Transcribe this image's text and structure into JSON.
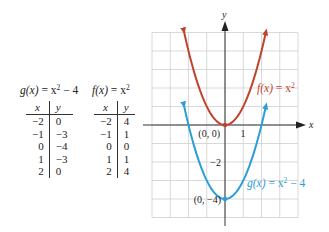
{
  "tables": [
    {
      "title_fn": "g(x)",
      "title_eq": " = x",
      "title_exp": "2",
      "title_tail": " − 4",
      "col_x": "x",
      "col_y": "y",
      "rows": [
        [
          "−2",
          "0"
        ],
        [
          "−1",
          "−3"
        ],
        [
          "0",
          "−4"
        ],
        [
          "1",
          "−3"
        ],
        [
          "2",
          "0"
        ]
      ]
    },
    {
      "title_fn": "f(x)",
      "title_eq": " = x",
      "title_exp": "2",
      "title_tail": "",
      "col_x": "x",
      "col_y": "y",
      "rows": [
        [
          "−2",
          "4"
        ],
        [
          "−1",
          "1"
        ],
        [
          "0",
          "0"
        ],
        [
          "1",
          "1"
        ],
        [
          "2",
          "4"
        ]
      ]
    }
  ],
  "chart_data": {
    "type": "line",
    "title": "",
    "xlabel": "x",
    "ylabel": "y",
    "xlim": [
      -4,
      4
    ],
    "ylim": [
      -5,
      5
    ],
    "grid": true,
    "tick_labels": {
      "x": [
        "1"
      ],
      "y": [
        "−2"
      ]
    },
    "series": [
      {
        "name": "f(x) = x²",
        "color": "#c0432b",
        "domain": [
          -2.25,
          2.25
        ],
        "points": [
          [
            -2,
            4
          ],
          [
            -1,
            1
          ],
          [
            0,
            0
          ],
          [
            1,
            1
          ],
          [
            2,
            4
          ]
        ]
      },
      {
        "name": "g(x) = x² − 4",
        "color": "#2a9fd6",
        "domain": [
          -2.25,
          2.25
        ],
        "points": [
          [
            -2,
            0
          ],
          [
            -1,
            -3
          ],
          [
            0,
            -4
          ],
          [
            1,
            -3
          ],
          [
            2,
            0
          ]
        ]
      }
    ],
    "annotations": [
      {
        "text": "(0, 0)",
        "x": 0,
        "y": 0
      },
      {
        "text": "(0, −4)",
        "x": 0,
        "y": -4
      }
    ],
    "labels": {
      "f_fn": "f(x)",
      "f_rest": " = x",
      "f_exp": "2",
      "g_fn": "g(x)",
      "g_rest": " = x",
      "g_exp": "2",
      "g_tail": " − 4",
      "origin": "(0, 0)",
      "vertex_g": "(0, −4)",
      "tick_x1": "1",
      "tick_ym2": "−2",
      "axis_x": "x",
      "axis_y": "y"
    }
  }
}
